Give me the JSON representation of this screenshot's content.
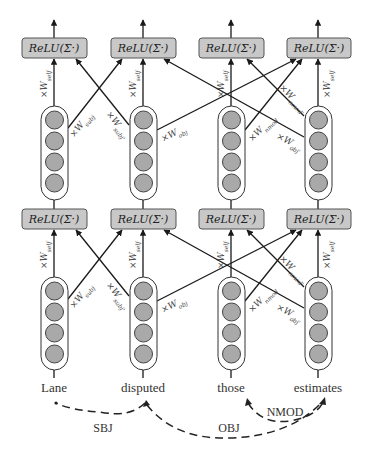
{
  "diagram": {
    "type": "graph-convolutional-network",
    "node_function_label": "ReLU(Σ·)",
    "weight_superscript": "(1)",
    "weight_prefix": "×W",
    "words": [
      "Lane",
      "disputed",
      "those",
      "estimates"
    ],
    "layers": [
      {
        "name": "layer-1",
        "relu_boxes": [
          "ReLU(Σ·)",
          "ReLU(Σ·)",
          "ReLU(Σ·)",
          "ReLU(Σ·)"
        ],
        "edge_labels": {
          "self": "self",
          "subj": "subj",
          "subj_rev": "subj'",
          "obj": "obj",
          "obj_rev": "obj'",
          "nmod": "nmod",
          "nmod_rev": "nmod'"
        }
      },
      {
        "name": "layer-2",
        "relu_boxes": [
          "ReLU(Σ·)",
          "ReLU(Σ·)",
          "ReLU(Σ·)",
          "ReLU(Σ·)"
        ],
        "edge_labels": {
          "self": "self",
          "subj": "subj",
          "subj_rev": "subj'",
          "obj": "obj",
          "obj_rev": "obj'",
          "nmod": "nmod",
          "nmod_rev": "nmod'"
        }
      }
    ],
    "dependencies": [
      {
        "label": "SBJ",
        "from": "disputed",
        "to": "Lane"
      },
      {
        "label": "OBJ",
        "from": "disputed",
        "to": "estimates"
      },
      {
        "label": "NMOD",
        "from": "estimates",
        "to": "those"
      }
    ],
    "colors": {
      "relu_fill": "#c8c8c8",
      "neuron_fill": "#a9a9a9",
      "line": "#1a1a1a"
    }
  }
}
